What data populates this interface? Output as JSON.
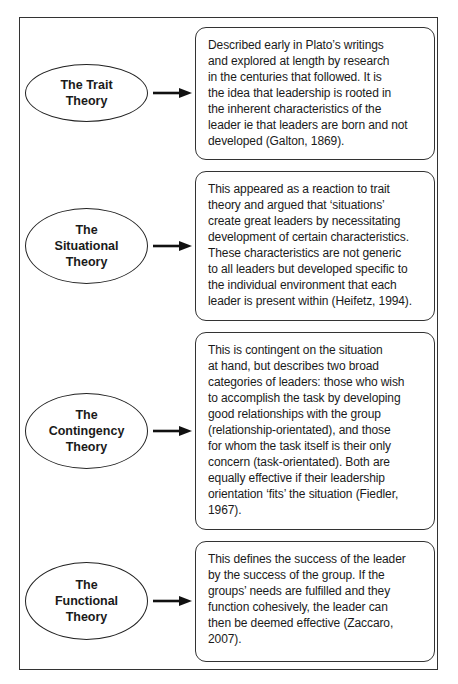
{
  "diagram": {
    "title": "",
    "theories": [
      {
        "name": "The Trait\nTheory",
        "description": "Described early in Plato’s writings\nand explored at length by research\nin the centuries that followed. It is\nthe idea that leadership is rooted in\nthe inherent characteristics of the\nleader ie that leaders are born and not\ndeveloped (Galton, 1869)."
      },
      {
        "name": "The\nSituational\nTheory",
        "description": "This appeared as a reaction to trait\ntheory and argued that ‘situations’\ncreate great leaders by necessitating\ndevelopment of certain characteristics.\nThese characteristics are not generic\nto all leaders but developed specific to\nthe individual environment that each\nleader is present within (Heifetz, 1994)."
      },
      {
        "name": "The\nContingency\nTheory",
        "description": "This is contingent on the situation\nat hand, but describes two broad\ncategories of leaders: those who wish\nto accomplish the task by developing\ngood relationships with the group\n(relationship-orientated), and those\nfor whom the task itself is their only\nconcern (task-orientated). Both are\nequally effective if their leadership\norientation ‘fits’ the situation (Fiedler,\n1967)."
      },
      {
        "name": "The\nFunctional\nTheory",
        "description": "This defines the success of the leader\nby the success of the group. If the\ngroups’ needs are fulfilled and they\nfunction cohesively, the leader can\nthen be deemed effective (Zaccaro,\n2007)."
      }
    ],
    "icons": {
      "connector": "right-arrow-icon"
    },
    "colors": {
      "stroke": "#222222",
      "text": "#1a1a1a",
      "background": "#ffffff"
    }
  }
}
